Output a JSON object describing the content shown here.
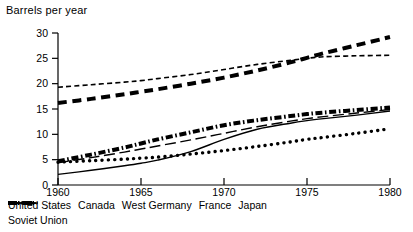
{
  "chart_data": {
    "type": "line",
    "title": "",
    "ylabel": "Barrels per year",
    "xlabel": "",
    "xlim": [
      1960,
      1980
    ],
    "ylim": [
      0,
      30
    ],
    "yticks": [
      0,
      5,
      10,
      15,
      20,
      25,
      30
    ],
    "xticks": [
      1960,
      1965,
      1970,
      1975,
      1980
    ],
    "grid": false,
    "legend_position": "below",
    "x": [
      1960,
      1962,
      1964,
      1965,
      1966,
      1968,
      1970,
      1972,
      1974,
      1975,
      1976,
      1978,
      1980
    ],
    "series": [
      {
        "name": "United States",
        "style": "dashed-thin",
        "values": [
          19.3,
          19.8,
          20.3,
          20.6,
          21.0,
          21.8,
          22.8,
          23.8,
          24.6,
          25.0,
          25.3,
          25.5,
          25.6
        ]
      },
      {
        "name": "Canada",
        "style": "dashed-thick",
        "values": [
          16.2,
          17.0,
          17.9,
          18.4,
          18.9,
          20.0,
          21.2,
          22.6,
          24.2,
          25.1,
          26.0,
          27.6,
          29.2
        ]
      },
      {
        "name": "West Germany",
        "style": "dash-dot-thick",
        "values": [
          4.7,
          6.0,
          7.4,
          8.2,
          9.0,
          10.4,
          11.8,
          12.8,
          13.6,
          14.0,
          14.3,
          14.8,
          15.3
        ]
      },
      {
        "name": "France",
        "style": "long-dash-thin",
        "values": [
          4.4,
          5.4,
          6.5,
          7.1,
          7.7,
          8.9,
          10.2,
          11.5,
          12.6,
          13.1,
          13.5,
          14.2,
          14.9
        ]
      },
      {
        "name": "Japan",
        "style": "solid-thin",
        "values": [
          2.1,
          2.9,
          3.8,
          4.3,
          4.9,
          6.6,
          9.0,
          11.0,
          12.2,
          12.7,
          13.1,
          13.8,
          14.6
        ]
      },
      {
        "name": "Soviet Union",
        "style": "dotted-thick",
        "values": [
          4.5,
          4.8,
          5.1,
          5.3,
          5.5,
          6.1,
          6.8,
          7.6,
          8.5,
          9.0,
          9.4,
          10.2,
          11.1
        ]
      }
    ]
  },
  "legend": {
    "items": [
      {
        "label": "United States",
        "style": "dashed-thin"
      },
      {
        "label": "Canada",
        "style": "dashed-thick"
      },
      {
        "label": "West Germany",
        "style": "dash-dot-thick"
      },
      {
        "label": "France",
        "style": "long-dash-thin"
      },
      {
        "label": "Japan",
        "style": "solid-thin"
      },
      {
        "label": "Soviet Union",
        "style": "dotted-thick"
      }
    ]
  },
  "colors": {
    "ink": "#000000",
    "background": "#ffffff"
  }
}
